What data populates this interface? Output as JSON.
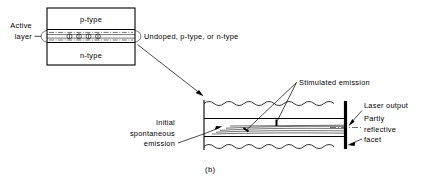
{
  "figure": {
    "caption": "(b)",
    "width": 423,
    "height": 185,
    "ink_color": "#000000",
    "background_color": "#ffffff"
  },
  "left_diagram": {
    "name": "double-heterostructure-cross-section",
    "labels": {
      "top_layer": "p-type",
      "bottom_layer": "n-type",
      "active_layer_line1": "Active",
      "active_layer_line2": "layer",
      "active_layer_composition": "Undoped, p-type, or n-type"
    },
    "carrier_symbol_count": 4,
    "carrier_symbol": "recombination-circle"
  },
  "right_diagram": {
    "name": "laser-cavity-longitudinal-section",
    "labels": {
      "stimulated_emission": "Stimulated emission",
      "initial_spontaneous_emission_line1": "Initial",
      "initial_spontaneous_emission_line2": "spontaneous",
      "initial_spontaneous_emission_line3": "emission",
      "laser_output": "Laser output",
      "partly_reflective_facet_line1": "Partly",
      "partly_reflective_facet_line2": "reflective",
      "partly_reflective_facet_line3": "facet"
    },
    "ray_count": 5,
    "facet_style": "thick-solid-vertical"
  }
}
